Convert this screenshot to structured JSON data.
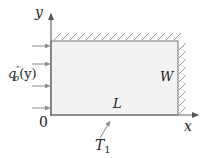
{
  "diagram": {
    "type": "heat-transfer-plate",
    "labels": {
      "y_axis": "y",
      "x_axis": "x",
      "origin": "0",
      "heat_flux_base": "q",
      "heat_flux_sup": "″",
      "heat_flux_sub": "o",
      "heat_flux_arg": "(y)",
      "width": "W",
      "length": "L",
      "temperature_base": "T",
      "temperature_sub": "1"
    },
    "boundaries": {
      "top": "insulated (hatched)",
      "right": "insulated (hatched)",
      "left": "heat flux q″o(y) applied",
      "bottom": "temperature T1"
    },
    "colors": {
      "plate_fill": "#f3f3f3",
      "plate_border": "#8a8a8a",
      "axis": "#666666",
      "hatch": "#9a9a9a",
      "flux_arrow": "#8a8a8a",
      "text": "#222222"
    }
  }
}
